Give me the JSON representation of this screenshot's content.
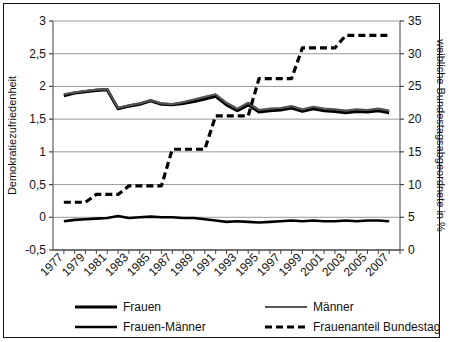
{
  "chart_data": {
    "type": "line",
    "title": "",
    "xlabel": "",
    "ylabel": "Demokratiezufriedenheit",
    "y2label": "weibliche Bundestagsabgeordnete in %",
    "xlim": [
      1976,
      2008
    ],
    "ylim": [
      -0.5,
      3
    ],
    "y2lim": [
      0,
      35
    ],
    "grid": true,
    "legend_position": "bottom",
    "xticks": [
      1977,
      1979,
      1981,
      1983,
      1985,
      1987,
      1989,
      1991,
      1993,
      1995,
      1997,
      1999,
      2001,
      2003,
      2005,
      2007
    ],
    "xtick_labels": [
      "1977",
      "1979",
      "1981",
      "1983",
      "1985",
      "1987",
      "1989",
      "1991",
      "1993",
      "1995",
      "1997",
      "1999",
      "2001",
      "2003",
      "2005",
      "2007"
    ],
    "yticks": [
      -0.5,
      0,
      0.5,
      1,
      1.5,
      2,
      2.5,
      3
    ],
    "ytick_labels": [
      "-0,5",
      "0",
      "0,5",
      "1",
      "1,5",
      "2",
      "2,5",
      "3"
    ],
    "y2ticks": [
      0,
      5,
      10,
      15,
      20,
      25,
      30,
      35
    ],
    "y2tick_labels": [
      "0",
      "5",
      "10",
      "15",
      "20",
      "25",
      "30",
      "35"
    ],
    "x": [
      1977,
      1978,
      1979,
      1980,
      1981,
      1982,
      1983,
      1984,
      1985,
      1986,
      1987,
      1988,
      1989,
      1990,
      1991,
      1992,
      1993,
      1994,
      1995,
      1996,
      1997,
      1998,
      1999,
      2000,
      2001,
      2002,
      2003,
      2004,
      2005,
      2006,
      2007
    ],
    "series": [
      {
        "name": "Frauen",
        "axis": "left",
        "style": "solid-thick",
        "color": "#000000",
        "values": [
          1.86,
          1.9,
          1.92,
          1.94,
          1.95,
          1.66,
          1.7,
          1.73,
          1.78,
          1.73,
          1.72,
          1.74,
          1.77,
          1.81,
          1.85,
          1.72,
          1.63,
          1.72,
          1.61,
          1.63,
          1.64,
          1.67,
          1.62,
          1.66,
          1.63,
          1.62,
          1.6,
          1.62,
          1.61,
          1.63,
          1.6
        ]
      },
      {
        "name": "Männer",
        "axis": "left",
        "style": "solid-medium",
        "color": "#555555",
        "values": [
          1.88,
          1.91,
          1.93,
          1.95,
          1.96,
          1.67,
          1.71,
          1.74,
          1.79,
          1.74,
          1.73,
          1.76,
          1.8,
          1.84,
          1.88,
          1.75,
          1.66,
          1.75,
          1.64,
          1.66,
          1.67,
          1.7,
          1.65,
          1.69,
          1.66,
          1.65,
          1.63,
          1.65,
          1.64,
          1.66,
          1.63
        ]
      },
      {
        "name": "Frauen-Männer",
        "axis": "left",
        "style": "solid-thin",
        "color": "#000000",
        "values": [
          -0.06,
          -0.04,
          -0.03,
          -0.02,
          -0.01,
          0.02,
          -0.01,
          0.0,
          0.01,
          0.0,
          0.0,
          -0.01,
          -0.01,
          -0.03,
          -0.05,
          -0.07,
          -0.06,
          -0.07,
          -0.08,
          -0.07,
          -0.06,
          -0.05,
          -0.06,
          -0.05,
          -0.06,
          -0.06,
          -0.05,
          -0.06,
          -0.05,
          -0.05,
          -0.06
        ]
      },
      {
        "name": "Frauenanteil Bundestag",
        "axis": "right",
        "style": "dashed",
        "color": "#000000",
        "values": [
          7.3,
          7.3,
          7.3,
          8.5,
          8.5,
          8.5,
          9.8,
          9.8,
          9.8,
          9.8,
          15.4,
          15.4,
          15.4,
          15.4,
          20.5,
          20.5,
          20.5,
          20.5,
          26.2,
          26.2,
          26.2,
          26.2,
          30.9,
          30.9,
          30.9,
          30.9,
          32.8,
          32.8,
          32.8,
          32.8,
          32.8
        ]
      }
    ],
    "legend": [
      {
        "label": "Frauen",
        "style": "solid-thick"
      },
      {
        "label": "Männer",
        "style": "solid-medium"
      },
      {
        "label": "Frauen-Männer",
        "style": "solid-thin"
      },
      {
        "label": "Frauenanteil Bundestag",
        "style": "dashed"
      }
    ]
  }
}
